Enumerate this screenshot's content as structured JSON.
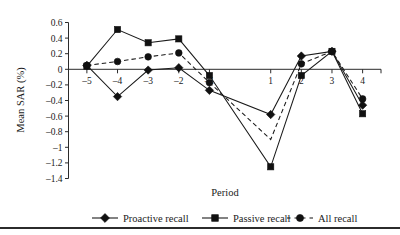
{
  "chart_data": {
    "type": "line",
    "title": "",
    "xlabel": "Period",
    "ylabel": "Mean SAR (%)",
    "x": [
      -5,
      -4,
      -3,
      -2,
      -1,
      1,
      2,
      3,
      4
    ],
    "xticklabels": [
      "–5",
      "–4",
      "–3",
      "–2",
      "–1",
      "1",
      "2",
      "3",
      "4"
    ],
    "yticks": [
      0.6,
      0.4,
      0.2,
      0,
      -0.2,
      -0.4,
      -0.6,
      -0.8,
      -1,
      -1.2,
      -1.4
    ],
    "yticklabels": [
      "0.6",
      "0.4",
      "0.2",
      "0",
      "–0.2",
      "–0.4",
      "–0.6",
      "–0.8",
      "–1",
      "–1.2",
      "–1.4"
    ],
    "ylim": [
      -1.4,
      0.6
    ],
    "xlim": [
      -5.6,
      4.6
    ],
    "grid": false,
    "legend_position": "bottom",
    "zero_line": true,
    "series": [
      {
        "name": "Proactive recall",
        "marker": "diamond",
        "linestyle": "solid",
        "color": "#1a1a1a",
        "values": [
          0.05,
          -0.35,
          -0.01,
          0.02,
          -0.27,
          -0.58,
          0.17,
          0.23,
          -0.46
        ]
      },
      {
        "name": "Passive recall",
        "marker": "square",
        "linestyle": "solid",
        "color": "#1a1a1a",
        "values": [
          0.04,
          0.51,
          0.34,
          0.39,
          -0.08,
          -1.25,
          -0.08,
          0.23,
          -0.57
        ]
      },
      {
        "name": "All recall",
        "marker": "circle",
        "linestyle": "dashed",
        "color": "#1a1a1a",
        "values": [
          0.05,
          0.1,
          0.16,
          0.21,
          -0.17,
          -0.9,
          0.07,
          0.23,
          -0.38
        ]
      }
    ]
  },
  "legend": {
    "items": [
      {
        "label": "Proactive recall"
      },
      {
        "label": "Passive recall"
      },
      {
        "label": "All recall"
      }
    ]
  },
  "axis": {
    "x_title": "Period",
    "y_title": "Mean SAR (%)"
  }
}
